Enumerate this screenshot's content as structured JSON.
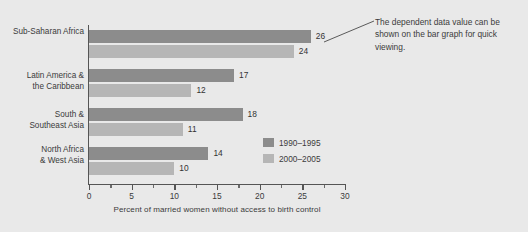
{
  "chart_data": {
    "type": "bar",
    "orientation": "horizontal",
    "title": "",
    "xlabel": "Percent of married women without access to birth control",
    "ylabel": "",
    "xlim": [
      0,
      30
    ],
    "xticks": [
      0,
      5,
      10,
      15,
      20,
      25,
      30
    ],
    "xtick_labels": [
      "0",
      "5",
      "10",
      "15",
      "20",
      "25",
      "30"
    ],
    "minor_tick_step": 2.5,
    "grid": false,
    "legend_position": "inside-right",
    "categories": [
      "Sub-Saharan Africa",
      "Latin America &\nthe Caribbean",
      "South &\nSoutheast Asia",
      "North Africa\n& West Asia"
    ],
    "series": [
      {
        "name": "1990–1995",
        "color": "#8c8c8c",
        "values": [
          26,
          17,
          18,
          14
        ]
      },
      {
        "name": "2000–2005",
        "color": "#b6b6b6",
        "values": [
          24,
          12,
          11,
          10
        ]
      }
    ],
    "value_labels": [
      [
        "26",
        "24"
      ],
      [
        "17",
        "12"
      ],
      [
        "18",
        "11"
      ],
      [
        "14",
        "10"
      ]
    ],
    "annotations": [
      {
        "text": "The dependent data value can be shown on the bar graph for quick viewing.",
        "target": "26",
        "leader_line": true
      }
    ]
  },
  "figure": {
    "background_color": "#e9e9e9",
    "axis_color": "#555555",
    "text_color": "#3b3b3b"
  }
}
